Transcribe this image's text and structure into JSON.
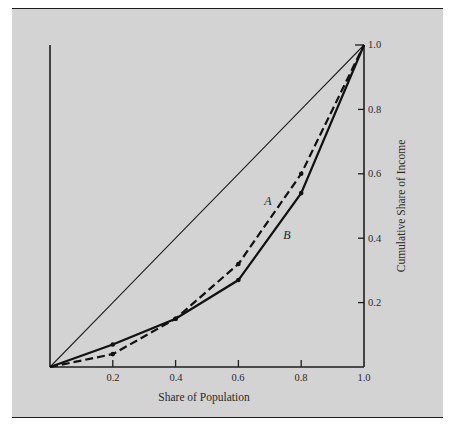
{
  "figure": {
    "x_axis_title": "Share of Population",
    "y_axis_title": "Cumulative Share of Income",
    "x_ticks": [
      "0.2",
      "0.4",
      "0.6",
      "0.8",
      "1.0"
    ],
    "y_ticks": [
      "0.2",
      "0.4",
      "0.6",
      "0.8",
      "1.0"
    ],
    "curve_labels": {
      "A": "A",
      "B": "B"
    },
    "colors": {
      "panel": "#d3d3d3",
      "ink": "#1e1e1e",
      "page": "#ffffff"
    }
  },
  "chart_data": {
    "type": "line",
    "title": "",
    "xlabel": "Share of Population",
    "ylabel": "Cumulative Share of Income",
    "x": [
      0,
      0.2,
      0.4,
      0.6,
      0.8,
      1.0
    ],
    "series": [
      {
        "name": "diagonal",
        "values": [
          0,
          0.2,
          0.4,
          0.6,
          0.8,
          1.0
        ],
        "style": "thin-solid",
        "markers": false
      },
      {
        "name": "A",
        "values": [
          0,
          0.04,
          0.15,
          0.32,
          0.6,
          1.0
        ],
        "style": "dashed",
        "markers": true
      },
      {
        "name": "B",
        "values": [
          0,
          0.07,
          0.15,
          0.27,
          0.54,
          1.0
        ],
        "style": "solid",
        "markers": true
      }
    ],
    "xlim": [
      0,
      1
    ],
    "ylim": [
      0,
      1
    ],
    "xticks": [
      0.2,
      0.4,
      0.6,
      0.8,
      1.0
    ],
    "yticks": [
      0.2,
      0.4,
      0.6,
      0.8,
      1.0
    ],
    "y_axis_side": "right",
    "grid": false,
    "legend": "none",
    "annotations": [
      {
        "text": "A",
        "x": 0.69,
        "y": 0.52
      },
      {
        "text": "B",
        "x": 0.755,
        "y": 0.41
      }
    ]
  }
}
